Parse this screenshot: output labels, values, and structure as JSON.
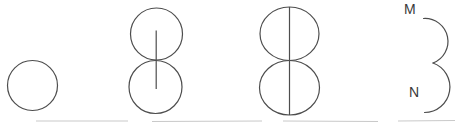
{
  "canvas": {
    "width": 455,
    "height": 125,
    "background": "#ffffff"
  },
  "style": {
    "line_color": "#4d4d4d",
    "label_color": "#3a3a3a",
    "baseline_color": "#c9c9c9"
  },
  "figures": {
    "fig1": {
      "description": "single circle"
    },
    "fig2": {
      "description": "two tangent stacked circles with short vertical segment between centers"
    },
    "fig3": {
      "description": "two tangent stacked circles with full vertical diameter line"
    },
    "fig4": {
      "description": "two right half-circle arcs between labeled endpoints",
      "label_top": "M",
      "label_bottom": "N"
    }
  }
}
